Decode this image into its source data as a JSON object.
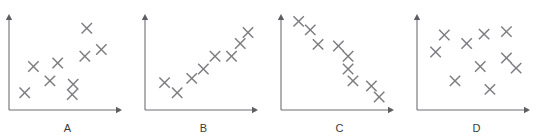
{
  "figure": {
    "width": 545,
    "height": 137,
    "background_color": "#ffffff",
    "axis_color": "#6e6e72",
    "marker_color": "#7c7c81",
    "label_color": "#3a3a3a",
    "marker_glyph": "x-cross"
  },
  "chart_data": [
    {
      "type": "scatter",
      "title": "A",
      "xlabel": "",
      "ylabel": "",
      "xlim": [
        0,
        100
      ],
      "ylim": [
        0,
        100
      ],
      "grid": false,
      "legend": "none",
      "marker": "x",
      "annotation": "moderate positive correlation",
      "points": [
        {
          "x": 10,
          "y": 12
        },
        {
          "x": 19,
          "y": 43
        },
        {
          "x": 44,
          "y": 47
        },
        {
          "x": 36,
          "y": 26
        },
        {
          "x": 60,
          "y": 22
        },
        {
          "x": 59,
          "y": 10
        },
        {
          "x": 74,
          "y": 88
        },
        {
          "x": 72,
          "y": 55
        },
        {
          "x": 89,
          "y": 63
        }
      ]
    },
    {
      "type": "scatter",
      "title": "B",
      "xlabel": "",
      "ylabel": "",
      "xlim": [
        0,
        100
      ],
      "ylim": [
        0,
        100
      ],
      "grid": false,
      "legend": "none",
      "marker": "x",
      "annotation": "strong positive correlation",
      "points": [
        {
          "x": 14,
          "y": 24
        },
        {
          "x": 27,
          "y": 12
        },
        {
          "x": 42,
          "y": 29
        },
        {
          "x": 54,
          "y": 40
        },
        {
          "x": 66,
          "y": 55
        },
        {
          "x": 83,
          "y": 55
        },
        {
          "x": 92,
          "y": 70
        },
        {
          "x": 100,
          "y": 83
        }
      ]
    },
    {
      "type": "scatter",
      "title": "C",
      "xlabel": "",
      "ylabel": "",
      "xlim": [
        0,
        100
      ],
      "ylim": [
        0,
        100
      ],
      "grid": false,
      "legend": "none",
      "marker": "x",
      "annotation": "strong negative correlation",
      "points": [
        {
          "x": 12,
          "y": 96
        },
        {
          "x": 24,
          "y": 86
        },
        {
          "x": 32,
          "y": 69
        },
        {
          "x": 53,
          "y": 67
        },
        {
          "x": 63,
          "y": 55
        },
        {
          "x": 63,
          "y": 40
        },
        {
          "x": 68,
          "y": 26
        },
        {
          "x": 87,
          "y": 20
        },
        {
          "x": 95,
          "y": 7
        }
      ]
    },
    {
      "type": "scatter",
      "title": "D",
      "xlabel": "",
      "ylabel": "",
      "xlim": [
        0,
        100
      ],
      "ylim": [
        0,
        100
      ],
      "grid": false,
      "legend": "none",
      "marker": "x",
      "annotation": "no correlation",
      "points": [
        {
          "x": 22,
          "y": 80
        },
        {
          "x": 45,
          "y": 70
        },
        {
          "x": 13,
          "y": 60
        },
        {
          "x": 63,
          "y": 81
        },
        {
          "x": 86,
          "y": 84
        },
        {
          "x": 86,
          "y": 53
        },
        {
          "x": 96,
          "y": 41
        },
        {
          "x": 59,
          "y": 43
        },
        {
          "x": 33,
          "y": 26
        },
        {
          "x": 69,
          "y": 16
        }
      ]
    }
  ],
  "panels": [
    {
      "id": "panel-a",
      "label": "A",
      "left": 0,
      "width": 135,
      "axis": {
        "origin_x": 9,
        "origin_y": 110,
        "y_top": 14,
        "x_right": 122
      }
    },
    {
      "id": "panel-b",
      "label": "B",
      "left": 136,
      "width": 135,
      "axis": {
        "origin_x": 9,
        "origin_y": 110,
        "y_top": 14,
        "x_right": 122
      }
    },
    {
      "id": "panel-c",
      "label": "C",
      "left": 272,
      "width": 135,
      "axis": {
        "origin_x": 9,
        "origin_y": 110,
        "y_top": 14,
        "x_right": 122
      }
    },
    {
      "id": "panel-d",
      "label": "D",
      "left": 408,
      "width": 137,
      "axis": {
        "origin_x": 9,
        "origin_y": 110,
        "y_top": 14,
        "x_right": 122
      }
    }
  ]
}
